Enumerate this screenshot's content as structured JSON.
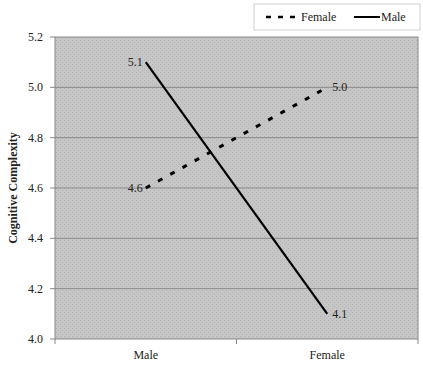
{
  "chart_data": {
    "type": "line",
    "title": "",
    "xlabel": "",
    "ylabel": "Cognitive Complexity",
    "categories": [
      "Male",
      "Female"
    ],
    "ylim": [
      4.0,
      5.2
    ],
    "yticks": [
      "4.0",
      "4.2",
      "4.4",
      "4.6",
      "4.8",
      "5.0",
      "5.2"
    ],
    "ytick_values": [
      4.0,
      4.2,
      4.4,
      4.6,
      4.8,
      5.0,
      5.2
    ],
    "grid": true,
    "legend_position": "top-right",
    "series": [
      {
        "name": "Female",
        "style": "dashed",
        "values": [
          4.6,
          5.0
        ],
        "labels": [
          "4.6",
          "5.0"
        ]
      },
      {
        "name": "Male",
        "style": "solid",
        "values": [
          5.1,
          4.1
        ],
        "labels": [
          "5.1",
          "4.1"
        ]
      }
    ],
    "colors": {
      "plot_background": "#c4c4c4",
      "gridline": "#8a8a8a",
      "line": "#000000"
    }
  }
}
